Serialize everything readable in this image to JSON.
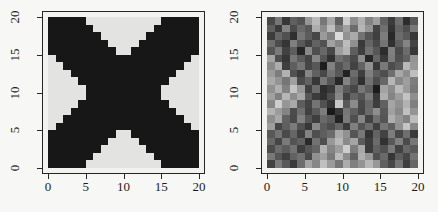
{
  "figure": {
    "background": "#f7f7f5",
    "text_color": "#1b1b1b",
    "frame_color": "#262626",
    "margin_color": "#f2f2f0"
  },
  "axis": {
    "x_ticks": [
      0,
      5,
      10,
      15,
      20
    ],
    "y_ticks": [
      0,
      5,
      10,
      15,
      20
    ],
    "x_range": [
      0,
      20
    ],
    "y_range": [
      0,
      20
    ]
  },
  "chart_data": [
    {
      "type": "heatmap",
      "subtype": "binary",
      "title": "",
      "xlabel": "",
      "ylabel": "",
      "x_range": [
        0,
        20
      ],
      "y_range": [
        0,
        20
      ],
      "grid_size": [
        20,
        20
      ],
      "legend": "none",
      "on_color": "#171717",
      "off_color": "#e3e3e1",
      "description": "true binary X image, # = black cell",
      "rows_top_to_bottom": [
        "#####..........#####",
        "######........######",
        "#######......#######",
        "########....########",
        "#########..#########",
        ".##################.",
        "..################..",
        "...##############...",
        "....############....",
        ".....##########.....",
        ".....##########.....",
        "....############....",
        "...##############...",
        "..################..",
        ".##################.",
        "#########..#########",
        "########....########",
        "#######......#######",
        "######........######",
        "#####..........#####"
      ]
    },
    {
      "type": "heatmap",
      "subtype": "grayscale",
      "title": "",
      "xlabel": "",
      "ylabel": "",
      "x_range": [
        0,
        20
      ],
      "y_range": [
        0,
        20
      ],
      "grid_size": [
        20,
        20
      ],
      "legend": "none",
      "description": "noisy grayscale version of the X image, 0=black 255=white",
      "values_top_to_bottom": [
        [
          72,
          118,
          55,
          96,
          83,
          150,
          185,
          120,
          168,
          95,
          203,
          142,
          176,
          130,
          158,
          98,
          60,
          110,
          45,
          88
        ],
        [
          95,
          58,
          130,
          74,
          105,
          88,
          172,
          140,
          190,
          125,
          160,
          108,
          182,
          148,
          67,
          112,
          52,
          99,
          78,
          121
        ],
        [
          60,
          102,
          81,
          47,
          118,
          92,
          70,
          155,
          128,
          218,
          146,
          170,
          115,
          85,
          63,
          125,
          41,
          107,
          90,
          55
        ],
        [
          110,
          76,
          53,
          127,
          89,
          64,
          98,
          82,
          162,
          135,
          188,
          144,
          58,
          101,
          73,
          116,
          49,
          94,
          132,
          68
        ],
        [
          84,
          122,
          66,
          93,
          38,
          136,
          79,
          104,
          71,
          158,
          180,
          95,
          62,
          113,
          87,
          45,
          128,
          75,
          108,
          56
        ],
        [
          165,
          78,
          54,
          119,
          91,
          68,
          133,
          85,
          49,
          112,
          96,
          74,
          140,
          38,
          102,
          58,
          124,
          80,
          97,
          148
        ],
        [
          138,
          172,
          62,
          95,
          117,
          70,
          88,
          30,
          129,
          83,
          106,
          66,
          99,
          145,
          57,
          121,
          76,
          92,
          184,
          152
        ],
        [
          155,
          125,
          178,
          81,
          59,
          134,
          97,
          72,
          115,
          88,
          35,
          108,
          63,
          127,
          94,
          79,
          110,
          168,
          142,
          190
        ],
        [
          170,
          148,
          118,
          160,
          75,
          98,
          55,
          120,
          86,
          40,
          131,
          92,
          48,
          114,
          77,
          103,
          182,
          136,
          158,
          125
        ],
        [
          145,
          175,
          130,
          195,
          152,
          64,
          107,
          45,
          58,
          126,
          90,
          71,
          118,
          95,
          28,
          163,
          140,
          186,
          155,
          120
        ],
        [
          160,
          128,
          182,
          140,
          168,
          87,
          60,
          48,
          78,
          135,
          66,
          100,
          84,
          122,
          57,
          174,
          132,
          157,
          195,
          143
        ],
        [
          135,
          205,
          150,
          170,
          93,
          68,
          116,
          81,
          54,
          200,
          89,
          138,
          72,
          104,
          61,
          97,
          165,
          145,
          178,
          128
        ],
        [
          180,
          155,
          132,
          76,
          111,
          64,
          90,
          125,
          25,
          57,
          119,
          95,
          70,
          107,
          142,
          88,
          160,
          137,
          192,
          148
        ],
        [
          142,
          168,
          98,
          73,
          129,
          86,
          62,
          105,
          91,
          35,
          123,
          79,
          134,
          67,
          113,
          85,
          175,
          150,
          130,
          188
        ],
        [
          158,
          70,
          95,
          124,
          81,
          55,
          137,
          92,
          77,
          101,
          59,
          128,
          84,
          109,
          64,
          118,
          96,
          145,
          196,
          135
        ],
        [
          88,
          116,
          74,
          102,
          63,
          131,
          79,
          94,
          108,
          170,
          146,
          85,
          120,
          52,
          99,
          67,
          125,
          72,
          111,
          58
        ],
        [
          104,
          69,
          122,
          83,
          97,
          42,
          114,
          78,
          152,
          185,
          138,
          164,
          91,
          61,
          107,
          50,
          88,
          129,
          75,
          118
        ],
        [
          76,
          108,
          92,
          115,
          62,
          86,
          100,
          178,
          133,
          157,
          205,
          125,
          168,
          59,
          97,
          81,
          122,
          66,
          104,
          89
        ],
        [
          120,
          85,
          64,
          98,
          112,
          73,
          145,
          160,
          122,
          186,
          140,
          98,
          175,
          150,
          80,
          106,
          54,
          93,
          70,
          115
        ],
        [
          66,
          124,
          90,
          58,
          109,
          165,
          135,
          192,
          155,
          118,
          172,
          128,
          148,
          183,
          152,
          95,
          71,
          117,
          62,
          102
        ]
      ]
    }
  ]
}
